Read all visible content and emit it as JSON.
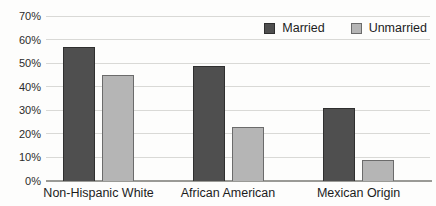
{
  "chart_data": {
    "type": "bar",
    "title": "",
    "xlabel": "",
    "ylabel": "",
    "categories": [
      "Non-Hispanic White",
      "African American",
      "Mexican Origin"
    ],
    "series": [
      {
        "name": "Married",
        "values": [
          57,
          49,
          31
        ],
        "color": "#4f4f4f",
        "border": "#2f2f2f"
      },
      {
        "name": "Unmarried",
        "values": [
          45,
          23,
          9
        ],
        "color": "#b5b5b5",
        "border": "#6b6b6b"
      }
    ],
    "ylim": [
      0,
      70
    ],
    "ytick_step": 10,
    "ytick_labels": [
      "0%",
      "10%",
      "20%",
      "30%",
      "40%",
      "50%",
      "60%",
      "70%"
    ],
    "grid": true,
    "legend_position": "top-right",
    "colors": {
      "gridline": "#d9d9d6",
      "axis": "#9a9a96",
      "text": "#1c1c1c"
    }
  }
}
